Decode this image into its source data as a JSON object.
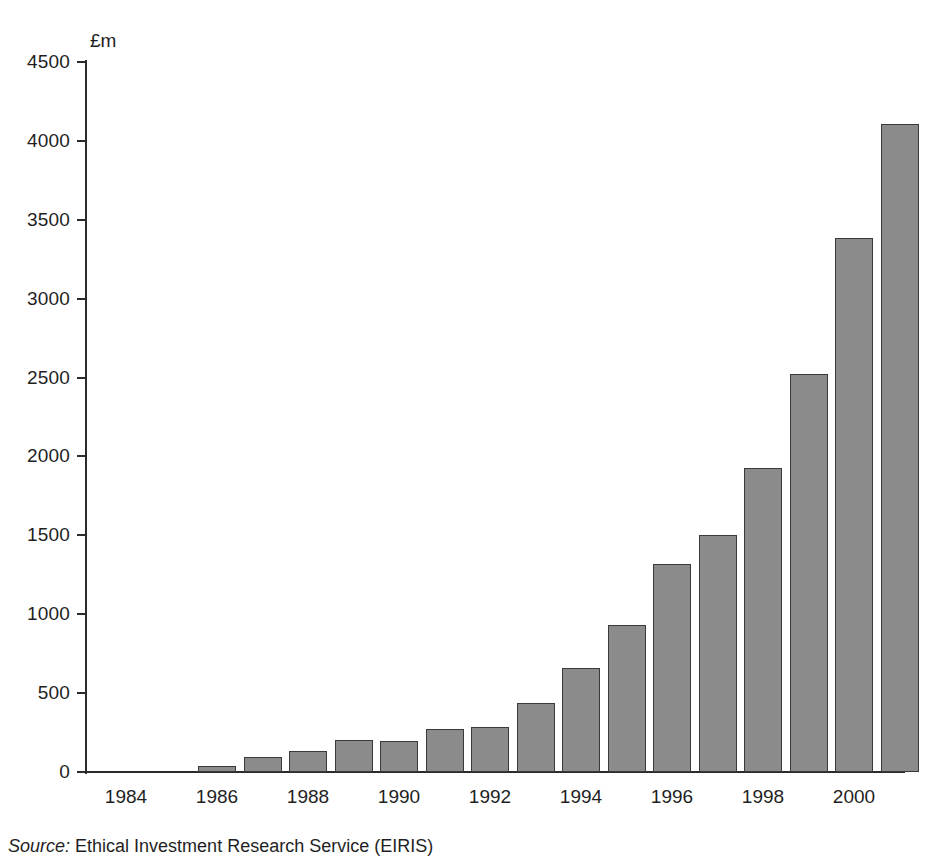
{
  "figure": {
    "unit_label": "£m",
    "source_keyword": "Source:",
    "source_text": "Ethical Investment Research Service (EIRIS)"
  },
  "colors": {
    "bar_fill": "#8b8b8b",
    "bar_edge": "#3a3a3a",
    "axis": "#2b2b2b",
    "text": "#1f1f1f",
    "background": "#ffffff"
  },
  "chart_data": {
    "type": "bar",
    "title": "",
    "subtitle": "",
    "xlabel": "",
    "ylabel": "£m",
    "ylim": [
      0,
      4500
    ],
    "xlim": [
      1984,
      2001
    ],
    "grid": false,
    "legend": null,
    "ytick_labels": [
      "0",
      "500",
      "1000",
      "1500",
      "2000",
      "2500",
      "3000",
      "3500",
      "4000",
      "4500"
    ],
    "ytick_values": [
      0,
      500,
      1000,
      1500,
      2000,
      2500,
      3000,
      3500,
      4000,
      4500
    ],
    "xtick_labels": [
      "1984",
      "1986",
      "1988",
      "1990",
      "1992",
      "1994",
      "1996",
      "1998",
      "2000"
    ],
    "xtick_values": [
      1984,
      1986,
      1988,
      1990,
      1992,
      1994,
      1996,
      1998,
      2000
    ],
    "categories": [
      1984,
      1985,
      1986,
      1987,
      1988,
      1989,
      1990,
      1991,
      1992,
      1993,
      1994,
      1995,
      1996,
      1997,
      1998,
      1999,
      2000,
      2001
    ],
    "values": [
      0,
      0,
      35,
      95,
      135,
      200,
      195,
      270,
      285,
      440,
      660,
      930,
      1320,
      1505,
      1930,
      2525,
      3385,
      4110
    ],
    "annotations": []
  }
}
